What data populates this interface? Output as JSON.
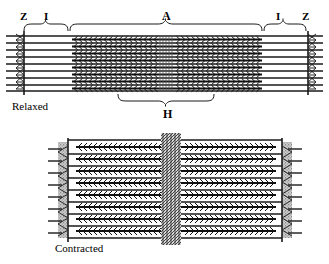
{
  "figure": {
    "panels": [
      {
        "id": "relaxed",
        "state_label": "Relaxed",
        "bands": [
          {
            "code": "Z",
            "name": "Z line",
            "side": "left"
          },
          {
            "code": "I",
            "name": "I band",
            "side": "left"
          },
          {
            "code": "A",
            "name": "A band",
            "side": "center"
          },
          {
            "code": "I",
            "name": "I band",
            "side": "right"
          },
          {
            "code": "Z",
            "name": "Z line",
            "side": "right"
          },
          {
            "code": "H",
            "name": "H zone",
            "side": "center-bottom"
          }
        ]
      },
      {
        "id": "contracted",
        "state_label": "Contracted",
        "bands": []
      }
    ]
  },
  "labels": {
    "z_left": "Z",
    "i_left": "I",
    "a_center": "A",
    "i_right": "I",
    "z_right": "Z",
    "h_center": "H",
    "relaxed": "Relaxed",
    "contracted": "Contracted"
  },
  "colors": {
    "ink": "#111111",
    "filament_dark": "#1a1a1a",
    "filament_mid": "#4a4a4a",
    "zline_fill": "#bdbdbd",
    "paper": "#ffffff"
  },
  "geometry": {
    "relaxed": {
      "z_left_x": 24,
      "z_right_x": 308,
      "a_start_x": 72,
      "a_end_x": 262,
      "m_line_x": 166,
      "h_start_x": 118,
      "h_end_x": 214,
      "top_y": 34,
      "bottom_y": 92,
      "rows": 8
    },
    "contracted": {
      "z_left_x": 68,
      "z_right_x": 282,
      "m_line_x": 172,
      "top_y": 138,
      "bottom_y": 240,
      "rows": 9
    }
  }
}
